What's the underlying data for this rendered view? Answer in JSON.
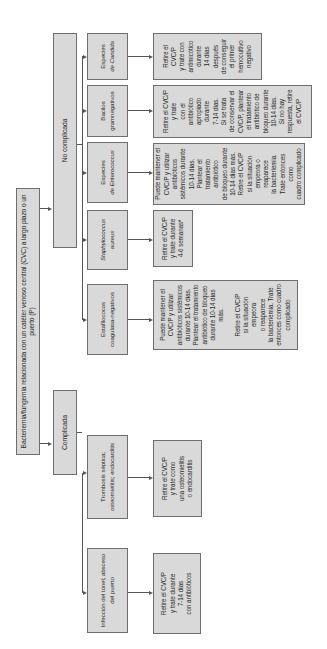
{
  "diagram": {
    "root": {
      "label": "Bacteriemia/fungemia relacionada con un catéter venoso central (CVC) a largo plazo o un puerto (P)"
    },
    "branches": [
      {
        "label": "Complicada",
        "children": [
          {
            "label": "Infección del túnel; absceso del puerto",
            "action": "Retire el CVC/P\ny trate durante\n7-14 días\ncon antibióticos"
          },
          {
            "label": "Trombosis séptica; osteomielitis; endocarditis",
            "action": "Retire el CVC/P\ny trate como\nuna osteomielitis\no endocarditis"
          }
        ]
      },
      {
        "label": "No complicada",
        "children": [
          {
            "label": "Estafilococos coagulasa-negativos",
            "action": "Puede mantener el\nCVC/P y utilizar\nantibióticos sistémicos\ndurante 10-14 días.\nPlantear el tratamiento\nantibiótico de bloqueo\ndurante 10-14 días más.\n\nRetire el CVC/P\nsi la situación empeora\no reaparece\nla bacteriemia. Trate\nentonces como cuadro\ncomplicado"
          },
          {
            "label_italic": "Staphylococcus",
            "label_italic2": "aureus",
            "label": "Staphylococcus aureus",
            "action": "Retire el CVC/P\ny trate durante\n4-6 semanasª"
          },
          {
            "label_prefix": "Especies",
            "label_italic": "de Enterococcus",
            "label": "Especies de Enterococcus",
            "action": "Puede mantener el\nCVC/P y utilizar\nantibióticos\nsistémicos durante\n10-14 días.\nPlantear el\ntratamiento antibiótico\nde bloqueo durante\n10-14 días más.\nRetire el CVC/P\nsi la situación\nempeora o reaparece\nla bacteriemia.\nTrate entonces como\ncuadro complicado"
          },
          {
            "label": "Bacilos gramnegativos",
            "action": "Retire el CVC/P\ny trate\ncon el antibiótico\napropiado durante\n7-14 días.\nSi se trata\nde conservar el\nCVC/P, plantear\nel tratamiento\nantibiótico de\nbloqueo durante\n10-14 días.\nSi no hay\nrespuesta, retire\nel CVC/P"
          },
          {
            "label_prefix": "Especies",
            "label_italic": "de Candida",
            "label": "Especies de Candida",
            "action": "Retire el CVC/P\ny trate con\nantimicótico\ndurante\n14 días\ndespués\nde conseguir\nel primer\nhemocultivo\nnegativo"
          }
        ]
      }
    ],
    "colors": {
      "box_fill": "#d9d9d9",
      "box_border": "#6e6e6e",
      "connector": "#555555"
    }
  }
}
